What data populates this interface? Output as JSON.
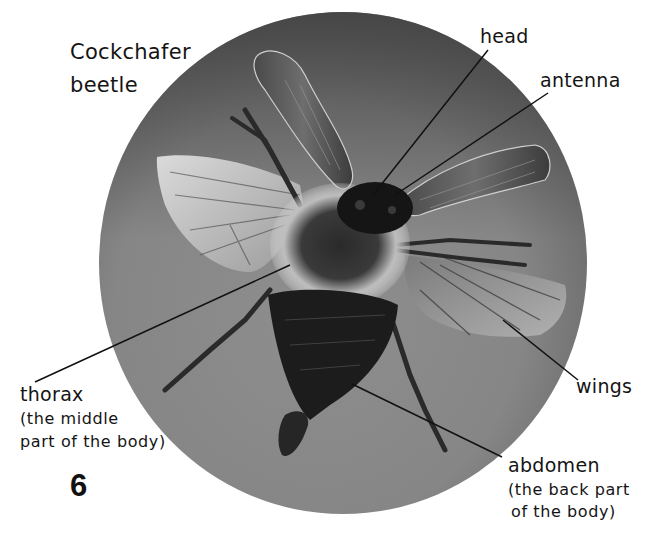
{
  "title": {
    "line1": "Cockchafer",
    "line2": "beetle"
  },
  "labels": {
    "head": "head",
    "antenna": "antenna",
    "thorax": "thorax",
    "thorax_desc_1": "(the middle",
    "thorax_desc_2": "part of the body)",
    "wings": "wings",
    "abdomen": "abdomen",
    "abdomen_desc_1": "(the back part",
    "abdomen_desc_2": "of the body)"
  },
  "page_number": "6",
  "colors": {
    "background": "#ffffff",
    "photo_circle_dark": "#4e4e4e",
    "photo_circle_light": "#8c8c8c",
    "text": "#141414"
  }
}
